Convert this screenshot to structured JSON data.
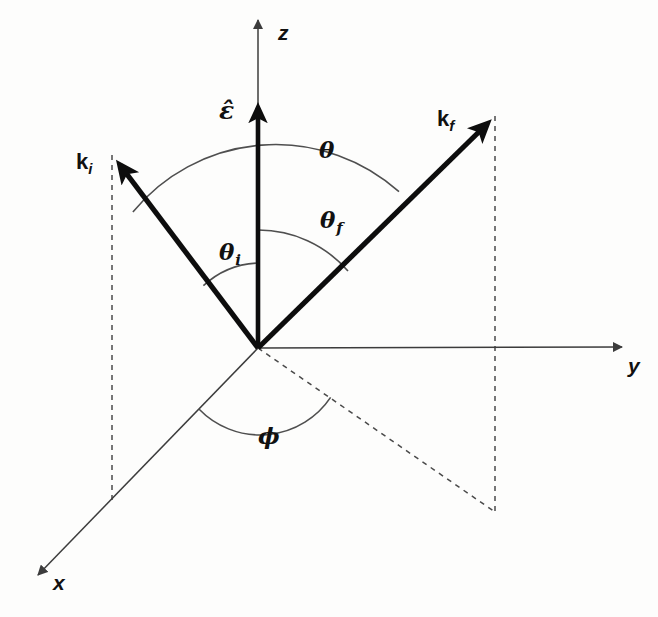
{
  "figure": {
    "background_color": "#fdfdfc",
    "line_color": "#0d0d0d",
    "axis_color": "#3c3c3c",
    "dash_color": "#4a4a4a",
    "arc_color": "#4f4f4f",
    "width": 658,
    "height": 617
  },
  "axes": [
    {
      "name": "z-axis",
      "label": "z",
      "direction": "up",
      "origin": [
        258,
        348
      ],
      "tip": [
        258,
        17
      ]
    },
    {
      "name": "y-axis",
      "label": "y",
      "direction": "right",
      "origin": [
        258,
        348
      ],
      "tip": [
        625,
        347
      ]
    },
    {
      "name": "x-axis",
      "label": "x",
      "direction": "down-left-out-of-page",
      "origin": [
        258,
        348
      ],
      "tip": [
        35,
        578
      ]
    }
  ],
  "vectors": [
    {
      "name": "incident-wavevector",
      "label": "k",
      "subscript": "i",
      "origin": [
        258,
        348
      ],
      "tip": [
        112,
        155
      ]
    },
    {
      "name": "scattered-wavevector",
      "label": "k",
      "subscript": "f",
      "origin": [
        258,
        348
      ],
      "tip": [
        495,
        116
      ]
    },
    {
      "name": "polarization-vector",
      "label": "ε̂",
      "subscript": "",
      "origin": [
        258,
        348
      ],
      "tip": [
        258,
        98
      ]
    }
  ],
  "angles": [
    {
      "name": "total-scattering-angle",
      "label": "θ",
      "subscript": "",
      "between": [
        "k_i",
        "k_f"
      ],
      "arc_radius": 185
    },
    {
      "name": "final-polar-angle",
      "label": "θ",
      "subscript": "f",
      "between": [
        "z",
        "k_f"
      ],
      "arc_radius": 118
    },
    {
      "name": "initial-polar-angle",
      "label": "θ",
      "subscript": "i",
      "between": [
        "z",
        "k_i"
      ],
      "arc_radius": 85
    },
    {
      "name": "azimuthal-angle",
      "label": "φ",
      "subscript": "",
      "between": [
        "x",
        "projection-of-k_f"
      ],
      "arc_radius": 85
    }
  ],
  "labels": {
    "z": "z",
    "y": "y",
    "x": "x",
    "k_base": "k",
    "k_i_sub": "i",
    "k_f_sub": "f",
    "epsilon_hat": "ε̂",
    "theta": "θ",
    "theta_f_base": "θ",
    "theta_f_sub": "f",
    "theta_i_base": "θ",
    "theta_i_sub": "i",
    "phi": "ϕ"
  },
  "projections": [
    {
      "name": "ki-vertical-projection",
      "from": [
        112,
        155
      ],
      "to": [
        112,
        500
      ]
    },
    {
      "name": "kf-vertical-projection",
      "from": [
        495,
        116
      ],
      "to": [
        495,
        512
      ]
    },
    {
      "name": "kf-ground-projection",
      "from": [
        258,
        348
      ],
      "to": [
        495,
        512
      ]
    }
  ]
}
